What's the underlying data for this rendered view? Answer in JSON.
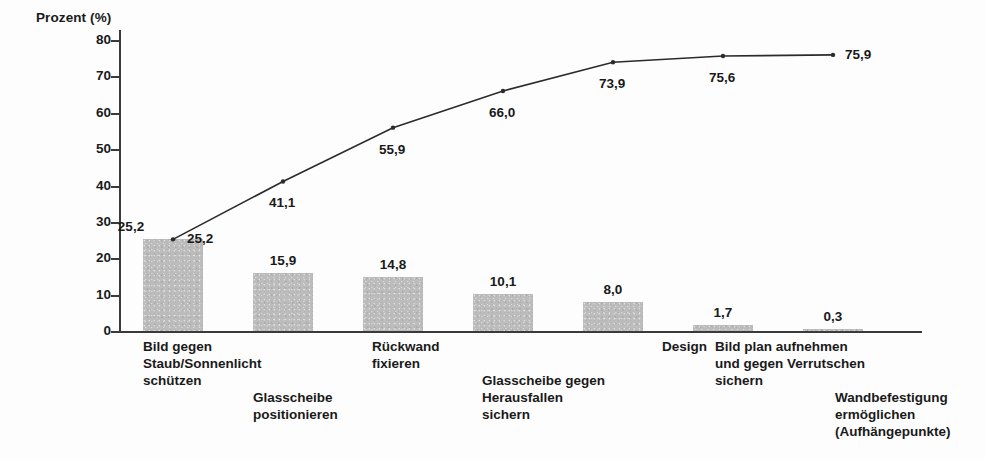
{
  "chart_data": {
    "type": "bar",
    "title": "",
    "subtitle": "",
    "xlabel": "",
    "ylabel": "Prozent (%)",
    "ylim": [
      0,
      85
    ],
    "yticks": [
      0,
      10,
      20,
      30,
      40,
      50,
      60,
      70,
      80
    ],
    "ytick_labels": [
      "0",
      "10",
      "20",
      "30",
      "40",
      "50",
      "60",
      "70",
      "80"
    ],
    "grid": false,
    "legend": "none",
    "decimal_separator": ",",
    "categories": [
      "Bild gegen\nStaub/Sonnenlicht\nschützen",
      "Glasscheibe\npositionieren",
      "Rückwand\nfixieren",
      "Glasscheibe gegen\nHerausfallen\nsichern",
      "Design",
      "Bild plan aufnehmen\nund gegen Verrutschen\nsichern",
      "Wandbefestigung\nermöglichen\n(Aufhängepunkte)"
    ],
    "series": [
      {
        "name": "Anteil",
        "type": "bar",
        "values": [
          25.2,
          15.9,
          14.8,
          10.1,
          8.0,
          1.7,
          0.3
        ],
        "labels": [
          "25,2",
          "15,9",
          "14,8",
          "10,1",
          "8,0",
          "1,7",
          "0,3"
        ]
      },
      {
        "name": "Kumuliert",
        "type": "line",
        "values": [
          25.2,
          41.1,
          55.9,
          66.0,
          73.9,
          75.6,
          75.9
        ],
        "labels": [
          "25,2",
          "41,1",
          "55,9",
          "66,0",
          "73,9",
          "75,6",
          "75,9"
        ]
      }
    ],
    "colors": {
      "bar_fill": "#bcbcbc",
      "line": "#2b2b2b",
      "axis": "#3a3a3a",
      "text": "#1a1a1a",
      "background": "#fdfdfd"
    }
  }
}
